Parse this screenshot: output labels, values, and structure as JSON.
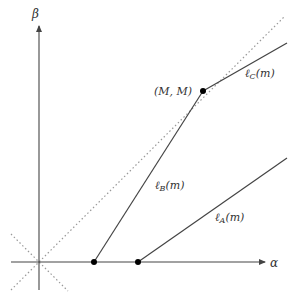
{
  "diagram": {
    "axes": {
      "x_label": "α",
      "y_label": "β"
    },
    "lines": [
      {
        "name": "ℓ_A(m)",
        "label_main": "ℓ",
        "label_sub": "A",
        "label_arg": "(m)",
        "from": "(a_A, 0)",
        "direction": "shallow slope to upper right"
      },
      {
        "name": "ℓ_B(m)",
        "label_main": "ℓ",
        "label_sub": "B",
        "label_arg": "(m)",
        "from": "(a_B, 0)",
        "to": "(M, M)"
      },
      {
        "name": "ℓ_C(m)",
        "label_main": "ℓ",
        "label_sub": "C",
        "label_arg": "(m)",
        "from": "(M, M)",
        "direction": "shallow slope to upper right"
      }
    ],
    "points": [
      {
        "label": "(M, M)"
      }
    ],
    "dotted_lines": [
      "diagonal β = α",
      "anti-diagonal β = -α"
    ],
    "colors": {
      "line": "#444444",
      "dotted": "#999999",
      "point": "#000000"
    }
  }
}
